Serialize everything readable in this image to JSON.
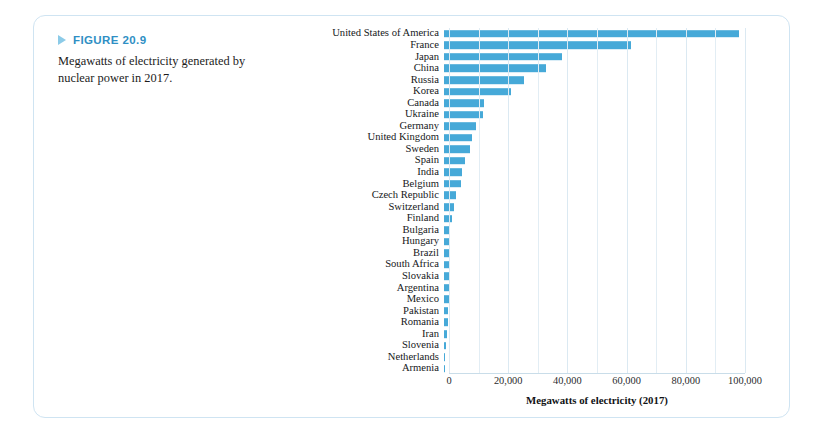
{
  "figure": {
    "label": "FIGURE 20.9",
    "caption": "Megawatts of electricity generated by nuclear power in 2017.",
    "arrow_icon": "triangle-right-icon",
    "accent_color": "#2f8fc4",
    "border_color": "#cfe4f2"
  },
  "chart_data": {
    "type": "bar",
    "orientation": "horizontal",
    "title": "",
    "xlabel": "Megawatts of electricity (2017)",
    "ylabel": "",
    "xlim": [
      0,
      100000
    ],
    "xticks": [
      0,
      20000,
      40000,
      60000,
      80000,
      100000
    ],
    "xtick_labels": [
      "0",
      "20,000",
      "40,000",
      "60,000",
      "80,000",
      "100,000"
    ],
    "gridlines": true,
    "gridline_interval": 10000,
    "legend": null,
    "bar_color": "#46a9d8",
    "categories": [
      "United States of America",
      "France",
      "Japan",
      "China",
      "Russia",
      "Korea",
      "Canada",
      "Ukraine",
      "Germany",
      "United Kingdom",
      "Sweden",
      "Spain",
      "India",
      "Belgium",
      "Czech Republic",
      "Switzerland",
      "Finland",
      "Bulgaria",
      "Hungary",
      "Brazil",
      "South Africa",
      "Slovakia",
      "Argentina",
      "Mexico",
      "Pakistan",
      "Romania",
      "Iran",
      "Slovenia",
      "Netherlands",
      "Armenia"
    ],
    "values": [
      99600,
      63100,
      39700,
      34500,
      27000,
      22500,
      13600,
      13100,
      10800,
      9400,
      8800,
      7100,
      6200,
      5900,
      3900,
      3300,
      2800,
      2000,
      1900,
      1900,
      1860,
      1810,
      1630,
      1550,
      1320,
      1300,
      900,
      690,
      480,
      380
    ]
  }
}
